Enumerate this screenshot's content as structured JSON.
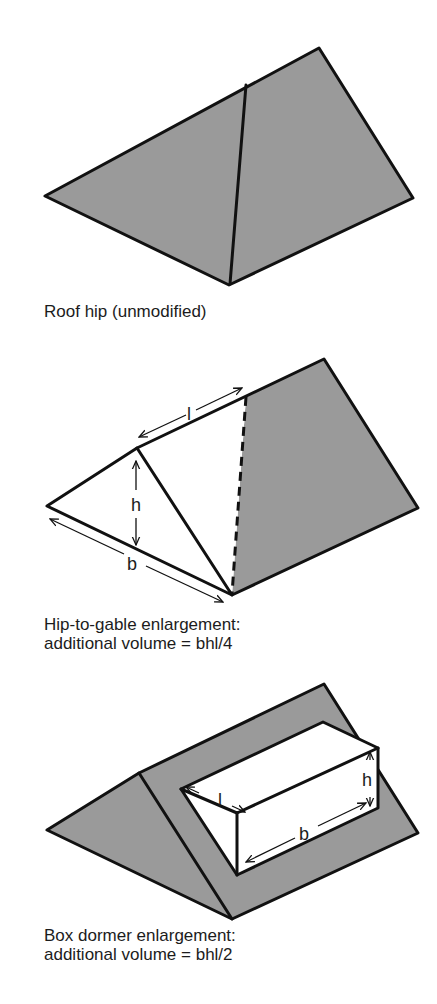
{
  "colors": {
    "roof_fill": "#9a9a9a",
    "line": "#111111",
    "text": "#1c1c1c",
    "background": "#ffffff"
  },
  "figures": [
    {
      "id": "roof-hip",
      "caption_lines": [
        "Roof hip (unmodified)"
      ],
      "labels": []
    },
    {
      "id": "hip-to-gable",
      "caption_lines": [
        "Hip-to-gable enlargement:",
        "additional volume = bhl/4"
      ],
      "labels": {
        "l": "l",
        "h": "h",
        "b": "b"
      }
    },
    {
      "id": "box-dormer",
      "caption_lines": [
        "Box dormer enlargement:",
        "additional volume = bhl/2"
      ],
      "labels": {
        "l": "l",
        "h": "h",
        "b": "b"
      }
    }
  ]
}
